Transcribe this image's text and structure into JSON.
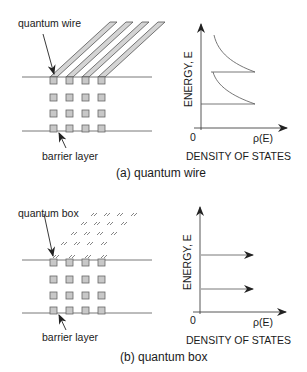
{
  "panel_a": {
    "wire_label": "quantum wire",
    "barrier_label": "barrier layer",
    "y_axis_label": "ENERGY, E",
    "origin_label": "0",
    "x_axis_symbol": "ρ(E)",
    "x_axis_label": "DENSITY OF STATES",
    "caption": "(a) quantum wire"
  },
  "panel_b": {
    "box_label": "quantum box",
    "barrier_label": "barrier layer",
    "y_axis_label": "ENERGY, E",
    "origin_label": "0",
    "x_axis_symbol": "ρ(E)",
    "x_axis_label": "DENSITY OF STATES",
    "caption": "(b) quantum box"
  },
  "colors": {
    "line": "#555555",
    "square_fill": "#c8c8c8",
    "square_stroke": "#666666",
    "wire_fill": "#d0d0d0"
  }
}
